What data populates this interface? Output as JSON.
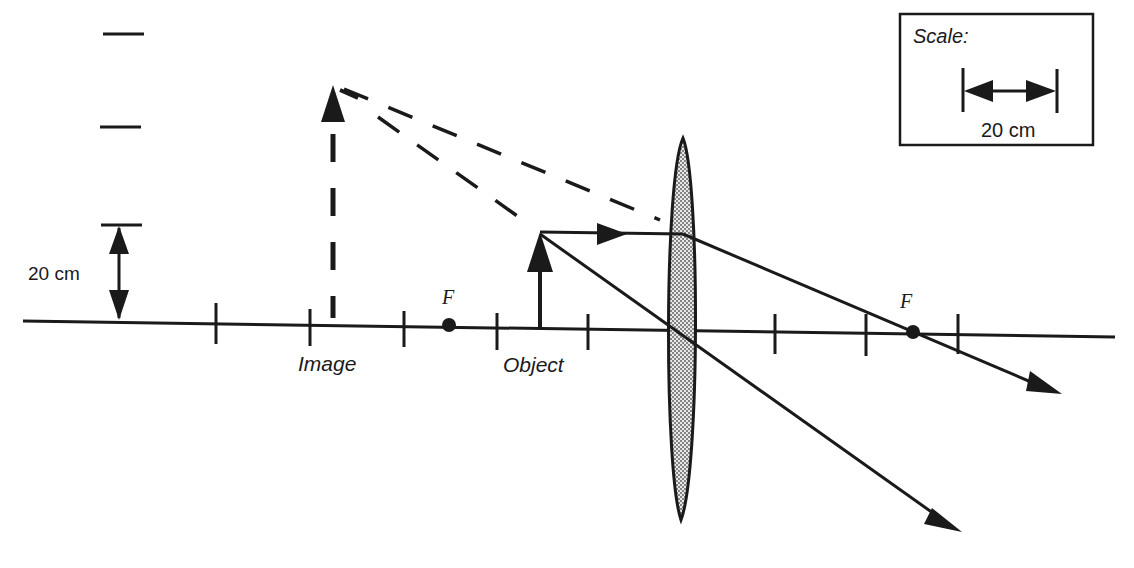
{
  "diagram": {
    "type": "converging-lens-ray-diagram",
    "labels": {
      "image": "Image",
      "object": "Object",
      "focal_left": "F",
      "focal_right": "F",
      "vertical_scale": "20 cm"
    },
    "scale_box": {
      "title": "Scale:",
      "value": "20 cm"
    },
    "colors": {
      "ink": "#1a1a1a",
      "background": "#ffffff",
      "lens_fill": "#b8b8b8"
    },
    "elements": {
      "optical_axis": "horizontal principal axis with tick marks",
      "lens": "shaded biconvex lens",
      "object_arrow": "solid upward arrow",
      "image_arrow": "dashed upward arrow (virtual image)",
      "rays": [
        "parallel ray refracted through far focal point",
        "central ray through lens center"
      ],
      "extensions": "dashed backward ray extensions meeting at image tip"
    }
  }
}
